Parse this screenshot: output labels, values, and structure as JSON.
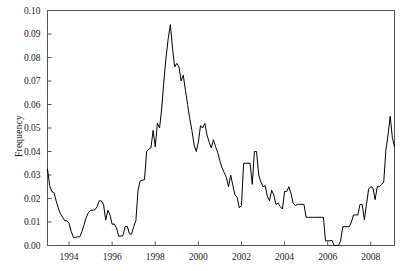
{
  "chart_data": {
    "type": "line",
    "title": "",
    "xlabel": "",
    "ylabel": "Frequency",
    "xlim": [
      1993.0,
      2009.1
    ],
    "ylim": [
      0.0,
      0.1
    ],
    "grid": false,
    "legend": null,
    "xticks": [
      1994,
      1996,
      1998,
      2000,
      2002,
      2004,
      2006,
      2008
    ],
    "xtick_labels": [
      "1994",
      "1996",
      "1998",
      "2000",
      "2002",
      "2004",
      "2006",
      "2008"
    ],
    "yticks": [
      0.0,
      0.01,
      0.02,
      0.03,
      0.04,
      0.05,
      0.06,
      0.07,
      0.08,
      0.09,
      0.1
    ],
    "ytick_labels": [
      "0.00",
      "0.01",
      "0.02",
      "0.03",
      "0.04",
      "0.05",
      "0.06",
      "0.07",
      "0.08",
      "0.09",
      "0.10"
    ],
    "line_color": "#000000",
    "line_width": 1.0,
    "series": [
      {
        "name": "Frequency",
        "x": [
          1993.0,
          1993.1,
          1993.2,
          1993.3,
          1993.4,
          1993.5,
          1993.6,
          1993.7,
          1993.8,
          1993.9,
          1994.0,
          1994.1,
          1994.2,
          1994.3,
          1994.4,
          1994.5,
          1994.6,
          1994.7,
          1994.8,
          1994.9,
          1995.0,
          1995.1,
          1995.2,
          1995.3,
          1995.4,
          1995.5,
          1995.6,
          1995.7,
          1995.8,
          1995.9,
          1996.0,
          1996.1,
          1996.2,
          1996.3,
          1996.4,
          1996.5,
          1996.6,
          1996.7,
          1996.8,
          1996.9,
          1997.0,
          1997.1,
          1997.2,
          1997.3,
          1997.4,
          1997.5,
          1997.6,
          1997.7,
          1997.8,
          1997.9,
          1998.0,
          1998.1,
          1998.2,
          1998.3,
          1998.4,
          1998.5,
          1998.6,
          1998.7,
          1998.8,
          1998.9,
          1999.0,
          1999.1,
          1999.2,
          1999.3,
          1999.4,
          1999.5,
          1999.6,
          1999.7,
          1999.8,
          1999.9,
          2000.0,
          2000.1,
          2000.2,
          2000.3,
          2000.4,
          2000.5,
          2000.6,
          2000.7,
          2000.8,
          2000.9,
          2001.0,
          2001.1,
          2001.2,
          2001.3,
          2001.4,
          2001.5,
          2001.6,
          2001.7,
          2001.8,
          2001.9,
          2002.0,
          2002.1,
          2002.2,
          2002.3,
          2002.4,
          2002.5,
          2002.6,
          2002.7,
          2002.8,
          2002.9,
          2003.0,
          2003.1,
          2003.2,
          2003.3,
          2003.4,
          2003.5,
          2003.6,
          2003.7,
          2003.8,
          2003.9,
          2004.0,
          2004.1,
          2004.2,
          2004.3,
          2004.4,
          2004.5,
          2004.6,
          2004.7,
          2004.8,
          2004.9,
          2005.0,
          2005.1,
          2005.2,
          2005.3,
          2005.4,
          2005.5,
          2005.6,
          2005.7,
          2005.8,
          2005.9,
          2006.0,
          2006.1,
          2006.2,
          2006.3,
          2006.4,
          2006.5,
          2006.6,
          2006.7,
          2006.8,
          2006.9,
          2007.0,
          2007.1,
          2007.2,
          2007.3,
          2007.4,
          2007.5,
          2007.6,
          2007.7,
          2007.8,
          2007.9,
          2008.0,
          2008.1,
          2008.2,
          2008.3,
          2008.4,
          2008.5,
          2008.6,
          2008.7,
          2008.8,
          2008.9,
          2009.0,
          2009.1
        ],
        "values": [
          0.0325,
          0.0255,
          0.023,
          0.0225,
          0.019,
          0.016,
          0.0135,
          0.012,
          0.0105,
          0.0105,
          0.0095,
          0.006,
          0.0035,
          0.0035,
          0.0037,
          0.0037,
          0.006,
          0.009,
          0.012,
          0.014,
          0.015,
          0.015,
          0.0152,
          0.0165,
          0.019,
          0.019,
          0.0175,
          0.0108,
          0.015,
          0.013,
          0.009,
          0.0092,
          0.0075,
          0.004,
          0.004,
          0.0042,
          0.008,
          0.0082,
          0.005,
          0.0048,
          0.008,
          0.0105,
          0.0235,
          0.0275,
          0.0278,
          0.028,
          0.04,
          0.041,
          0.0415,
          0.049,
          0.042,
          0.052,
          0.05,
          0.0585,
          0.07,
          0.08,
          0.088,
          0.094,
          0.084,
          0.076,
          0.0775,
          0.076,
          0.07,
          0.0725,
          0.066,
          0.06,
          0.054,
          0.049,
          0.043,
          0.04,
          0.044,
          0.051,
          0.05,
          0.052,
          0.047,
          0.044,
          0.0415,
          0.045,
          0.042,
          0.0395,
          0.036,
          0.033,
          0.031,
          0.029,
          0.025,
          0.03,
          0.0255,
          0.0215,
          0.0205,
          0.016,
          0.017,
          0.035,
          0.035,
          0.035,
          0.035,
          0.026,
          0.04,
          0.04,
          0.03,
          0.027,
          0.025,
          0.0255,
          0.021,
          0.019,
          0.0235,
          0.0215,
          0.0175,
          0.018,
          0.0165,
          0.0155,
          0.023,
          0.023,
          0.025,
          0.022,
          0.018,
          0.017,
          0.0175,
          0.0175,
          0.0175,
          0.0175,
          0.012,
          0.012,
          0.012,
          0.012,
          0.012,
          0.012,
          0.012,
          0.012,
          0.012,
          0.002,
          0.002,
          0.002,
          0.0022,
          0.0,
          0.0,
          0.0,
          0.002,
          0.008,
          0.008,
          0.008,
          0.008,
          0.01,
          0.013,
          0.013,
          0.013,
          0.0175,
          0.0175,
          0.011,
          0.0175,
          0.024,
          0.025,
          0.0245,
          0.0195,
          0.025,
          0.025,
          0.026,
          0.027,
          0.0405,
          0.047,
          0.055,
          0.046,
          0.042
        ]
      }
    ]
  }
}
